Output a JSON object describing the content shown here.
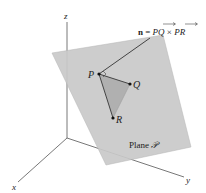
{
  "diagram": {
    "type": "3d-plane-normal-vector",
    "axes": {
      "x_label": "x",
      "y_label": "y",
      "z_label": "z"
    },
    "points": [
      {
        "name": "P",
        "label": "P"
      },
      {
        "name": "Q",
        "label": "Q"
      },
      {
        "name": "R",
        "label": "R"
      }
    ],
    "normal_label": {
      "bold": "n",
      "equals": " = ",
      "vec1": "PQ",
      "times": " × ",
      "vec2": "PR"
    },
    "plane_label": {
      "text": "Plane ",
      "symbol": "𝒫"
    },
    "colors": {
      "plane_fill": "#c9c9c9",
      "plane_edge": "#b5b5b5",
      "triangle_fill": "#b3b3b3",
      "line": "#444444",
      "axis": "#555555"
    }
  }
}
